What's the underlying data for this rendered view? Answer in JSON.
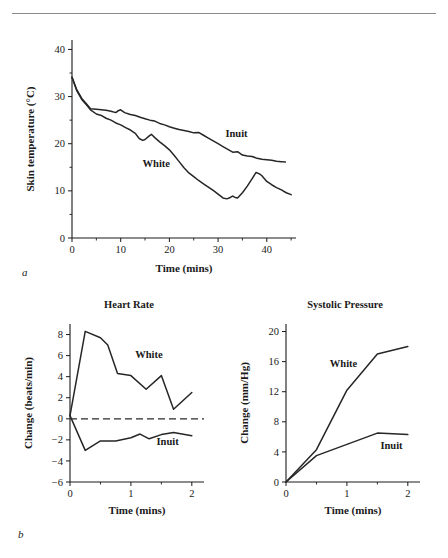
{
  "figure": {
    "panel_a_label": "a",
    "panel_b_label": "b"
  },
  "chart_data": [
    {
      "id": "skin-temperature",
      "type": "line",
      "title": "",
      "xlabel": "Time (mins)",
      "ylabel": "Skin temperature (°C)",
      "xlim": [
        0,
        46
      ],
      "ylim": [
        0,
        42
      ],
      "xticks": [
        0,
        10,
        20,
        30,
        40
      ],
      "xticklabels": [
        "0",
        "10",
        "20",
        "30",
        "40"
      ],
      "xminor": [
        5,
        15,
        25,
        35,
        45
      ],
      "yticks": [
        0,
        10,
        20,
        30,
        40
      ],
      "yticklabels": [
        "0",
        "10",
        "20",
        "30",
        "40"
      ],
      "yminor": [
        5,
        15,
        25,
        35
      ],
      "grid": false,
      "legend_position": "inline-annotation",
      "series": [
        {
          "name": "Inuit",
          "label_x": 31.5,
          "label_y": 21.5,
          "x": [
            0,
            1,
            2,
            3,
            3.8,
            5,
            6,
            7,
            8,
            9,
            9.5,
            10,
            10.8,
            12,
            13,
            14,
            15,
            16,
            17,
            18,
            19,
            20,
            21,
            22,
            23,
            24,
            25,
            26,
            27,
            28,
            29,
            30,
            31,
            32,
            33,
            34,
            35,
            36,
            37,
            38,
            39,
            40,
            41,
            42,
            43,
            43.8
          ],
          "y": [
            34.1,
            31.4,
            29.6,
            28.4,
            27.4,
            27.3,
            27.2,
            27.1,
            26.9,
            26.6,
            27.0,
            27.2,
            26.6,
            26.2,
            26.0,
            25.6,
            25.3,
            25.0,
            24.8,
            24.3,
            24.0,
            23.6,
            23.3,
            23.0,
            22.8,
            22.6,
            22.3,
            22.4,
            21.8,
            21.2,
            20.6,
            20.0,
            19.4,
            18.8,
            18.2,
            18.3,
            17.6,
            17.4,
            17.3,
            16.9,
            16.7,
            16.6,
            16.5,
            16.3,
            16.2,
            16.1
          ]
        },
        {
          "name": "White",
          "label_x": 14.5,
          "label_y": 15.0,
          "x": [
            0,
            1,
            2,
            3,
            3.8,
            5,
            6,
            7,
            8,
            9,
            10,
            11,
            12,
            13,
            13.8,
            14.5,
            15,
            15.8,
            16.3,
            17,
            18,
            19,
            20,
            21,
            22,
            23,
            24,
            25,
            26,
            27,
            28,
            29,
            30,
            31,
            31.8,
            32.5,
            33,
            33.5,
            34,
            35,
            36,
            37,
            37.8,
            38.5,
            39,
            40,
            41,
            42,
            43,
            44,
            45
          ],
          "y": [
            34.1,
            31.2,
            29.4,
            28.2,
            27.2,
            26.3,
            26.0,
            25.4,
            25.0,
            24.4,
            24.0,
            23.4,
            22.9,
            22.2,
            21.1,
            20.7,
            20.9,
            21.6,
            22.0,
            21.3,
            20.4,
            19.6,
            18.7,
            17.5,
            16.2,
            14.9,
            13.8,
            13.0,
            12.2,
            11.5,
            10.8,
            10.1,
            9.3,
            8.5,
            8.3,
            8.6,
            8.9,
            8.6,
            8.5,
            9.6,
            11.0,
            12.6,
            13.9,
            13.6,
            13.2,
            12.0,
            11.3,
            10.7,
            10.2,
            9.6,
            9.2
          ]
        }
      ]
    },
    {
      "id": "heart-rate",
      "type": "line",
      "title": "Heart Rate",
      "xlabel": "Time (mins)",
      "ylabel": "Change (beats/min)",
      "xlim": [
        0,
        2.2
      ],
      "ylim": [
        -6,
        9
      ],
      "xticks": [
        0,
        1,
        2
      ],
      "xticklabels": [
        "0",
        "1",
        "2"
      ],
      "xminor": [
        0.5,
        1.5
      ],
      "yticks": [
        -6,
        -4,
        -2,
        0,
        2,
        4,
        6,
        8
      ],
      "yticklabels": [
        "−6",
        "−4",
        "−2",
        "0",
        "2",
        "4",
        "6",
        "8"
      ],
      "grid": false,
      "zeroline": 0,
      "legend_position": "inline-annotation",
      "series": [
        {
          "name": "White",
          "label_x": 1.07,
          "label_y": 5.8,
          "x": [
            0,
            0.25,
            0.5,
            0.62,
            0.78,
            1.0,
            1.25,
            1.5,
            1.7,
            2.0
          ],
          "y": [
            0.3,
            8.3,
            7.7,
            7.0,
            4.3,
            4.1,
            2.8,
            4.1,
            0.9,
            2.5
          ]
        },
        {
          "name": "Inuit",
          "label_x": 1.42,
          "label_y": -2.5,
          "x": [
            0,
            0.25,
            0.5,
            0.75,
            1.0,
            1.15,
            1.3,
            1.5,
            1.7,
            2.0
          ],
          "y": [
            0.3,
            -3.0,
            -2.1,
            -2.1,
            -1.8,
            -1.45,
            -1.9,
            -1.5,
            -1.3,
            -1.6
          ]
        }
      ]
    },
    {
      "id": "systolic-pressure",
      "type": "line",
      "title": "Systolic Pressure",
      "xlabel": "Time (mins)",
      "ylabel": "Change (mm/Hg)",
      "xlim": [
        0,
        2.2
      ],
      "ylim": [
        0,
        21
      ],
      "xticks": [
        0,
        1,
        2
      ],
      "xticklabels": [
        "0",
        "1",
        "2"
      ],
      "xminor": [
        0.5,
        1.5
      ],
      "yticks": [
        0,
        4,
        8,
        12,
        16,
        20
      ],
      "yticklabels": [
        "0",
        "4",
        "8",
        "12",
        "16",
        "20"
      ],
      "grid": false,
      "legend_position": "inline-annotation",
      "series": [
        {
          "name": "White",
          "label_x": 0.72,
          "label_y": 15.3,
          "x": [
            0,
            0.5,
            1.0,
            1.5,
            2.0
          ],
          "y": [
            0,
            4.3,
            12.2,
            17.0,
            18.0
          ]
        },
        {
          "name": "Inuit",
          "label_x": 1.55,
          "label_y": 4.4,
          "x": [
            0,
            0.5,
            1.0,
            1.5,
            2.0
          ],
          "y": [
            0,
            3.5,
            5.0,
            6.5,
            6.3
          ]
        }
      ]
    }
  ]
}
